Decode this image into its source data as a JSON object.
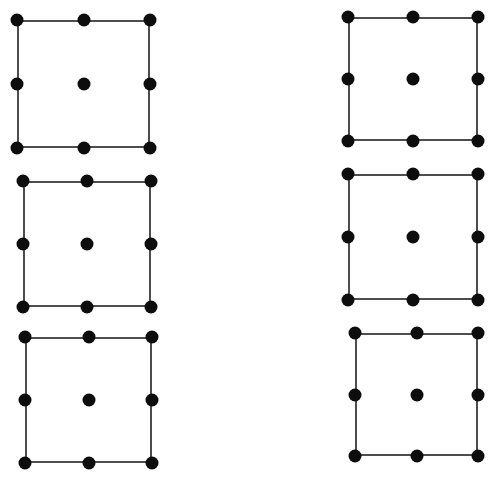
{
  "figure": {
    "canvas_width": 498,
    "canvas_height": 478,
    "background_color": "#ffffff",
    "border_color": "#4d4d4d",
    "border_width": 2,
    "dot_color": "#0d0d0d",
    "dot_diameter": 13,
    "dot_grid": "3x3",
    "dots_per_square": 9,
    "square_count": 6,
    "squares": [
      {
        "id": "square-1",
        "label": "top-left square",
        "x": 17,
        "y": 20,
        "width": 133,
        "height": 128,
        "dot_diameter": 13,
        "dots": [
          {
            "name": "top-left-dot",
            "cx": 0,
            "cy": 0
          },
          {
            "name": "top-center-dot",
            "cx": 0.5,
            "cy": 0
          },
          {
            "name": "top-right-dot",
            "cx": 1,
            "cy": 0
          },
          {
            "name": "middle-left-dot",
            "cx": 0,
            "cy": 0.5
          },
          {
            "name": "center-dot",
            "cx": 0.5,
            "cy": 0.5
          },
          {
            "name": "middle-right-dot",
            "cx": 1,
            "cy": 0.5
          },
          {
            "name": "bottom-left-dot",
            "cx": 0,
            "cy": 1
          },
          {
            "name": "bottom-center-dot",
            "cx": 0.5,
            "cy": 1
          },
          {
            "name": "bottom-right-dot",
            "cx": 1,
            "cy": 1
          }
        ]
      },
      {
        "id": "square-2",
        "label": "top-right square",
        "x": 348,
        "y": 17,
        "width": 130,
        "height": 124,
        "dot_diameter": 13,
        "dots": [
          {
            "name": "top-left-dot",
            "cx": 0,
            "cy": 0
          },
          {
            "name": "top-center-dot",
            "cx": 0.5,
            "cy": 0
          },
          {
            "name": "top-right-dot",
            "cx": 1,
            "cy": 0
          },
          {
            "name": "middle-left-dot",
            "cx": 0,
            "cy": 0.5
          },
          {
            "name": "center-dot",
            "cx": 0.5,
            "cy": 0.5
          },
          {
            "name": "middle-right-dot",
            "cx": 1,
            "cy": 0.5
          },
          {
            "name": "bottom-left-dot",
            "cx": 0,
            "cy": 1
          },
          {
            "name": "bottom-center-dot",
            "cx": 0.5,
            "cy": 1
          },
          {
            "name": "bottom-right-dot",
            "cx": 1,
            "cy": 1
          }
        ]
      },
      {
        "id": "square-3",
        "label": "middle-left square",
        "x": 23,
        "y": 181,
        "width": 128,
        "height": 126,
        "dot_diameter": 13,
        "dots": [
          {
            "name": "top-left-dot",
            "cx": 0,
            "cy": 0
          },
          {
            "name": "top-center-dot",
            "cx": 0.5,
            "cy": 0
          },
          {
            "name": "top-right-dot",
            "cx": 1,
            "cy": 0
          },
          {
            "name": "middle-left-dot",
            "cx": 0,
            "cy": 0.5
          },
          {
            "name": "center-dot",
            "cx": 0.5,
            "cy": 0.5
          },
          {
            "name": "middle-right-dot",
            "cx": 1,
            "cy": 0.5
          },
          {
            "name": "bottom-left-dot",
            "cx": 0,
            "cy": 1
          },
          {
            "name": "bottom-center-dot",
            "cx": 0.5,
            "cy": 1
          },
          {
            "name": "bottom-right-dot",
            "cx": 1,
            "cy": 1
          }
        ]
      },
      {
        "id": "square-4",
        "label": "middle-right square",
        "x": 348,
        "y": 174,
        "width": 130,
        "height": 126,
        "dot_diameter": 13,
        "dots": [
          {
            "name": "top-left-dot",
            "cx": 0,
            "cy": 0
          },
          {
            "name": "top-center-dot",
            "cx": 0.5,
            "cy": 0
          },
          {
            "name": "top-right-dot",
            "cx": 1,
            "cy": 0
          },
          {
            "name": "middle-left-dot",
            "cx": 0,
            "cy": 0.5
          },
          {
            "name": "center-dot",
            "cx": 0.5,
            "cy": 0.5
          },
          {
            "name": "middle-right-dot",
            "cx": 1,
            "cy": 0.5
          },
          {
            "name": "bottom-left-dot",
            "cx": 0,
            "cy": 1
          },
          {
            "name": "bottom-center-dot",
            "cx": 0.5,
            "cy": 1
          },
          {
            "name": "bottom-right-dot",
            "cx": 1,
            "cy": 1
          }
        ]
      },
      {
        "id": "square-5",
        "label": "bottom-left square",
        "x": 25,
        "y": 337,
        "width": 127,
        "height": 126,
        "dot_diameter": 13,
        "dots": [
          {
            "name": "top-left-dot",
            "cx": 0,
            "cy": 0
          },
          {
            "name": "top-center-dot",
            "cx": 0.5,
            "cy": 0
          },
          {
            "name": "top-right-dot",
            "cx": 1,
            "cy": 0
          },
          {
            "name": "middle-left-dot",
            "cx": 0,
            "cy": 0.5
          },
          {
            "name": "center-dot",
            "cx": 0.5,
            "cy": 0.5
          },
          {
            "name": "middle-right-dot",
            "cx": 1,
            "cy": 0.5
          },
          {
            "name": "bottom-left-dot",
            "cx": 0,
            "cy": 1
          },
          {
            "name": "bottom-center-dot",
            "cx": 0.5,
            "cy": 1
          },
          {
            "name": "bottom-right-dot",
            "cx": 1,
            "cy": 1
          }
        ]
      },
      {
        "id": "square-6",
        "label": "bottom-right square",
        "x": 355,
        "y": 333,
        "width": 123,
        "height": 123,
        "dot_diameter": 13,
        "dots": [
          {
            "name": "top-left-dot",
            "cx": 0,
            "cy": 0
          },
          {
            "name": "top-center-dot",
            "cx": 0.5,
            "cy": 0
          },
          {
            "name": "top-right-dot",
            "cx": 1,
            "cy": 0
          },
          {
            "name": "middle-left-dot",
            "cx": 0,
            "cy": 0.5
          },
          {
            "name": "center-dot",
            "cx": 0.5,
            "cy": 0.5
          },
          {
            "name": "middle-right-dot",
            "cx": 1,
            "cy": 0.5
          },
          {
            "name": "bottom-left-dot",
            "cx": 0,
            "cy": 1
          },
          {
            "name": "bottom-center-dot",
            "cx": 0.5,
            "cy": 1
          },
          {
            "name": "bottom-right-dot",
            "cx": 1,
            "cy": 1
          }
        ]
      }
    ]
  }
}
